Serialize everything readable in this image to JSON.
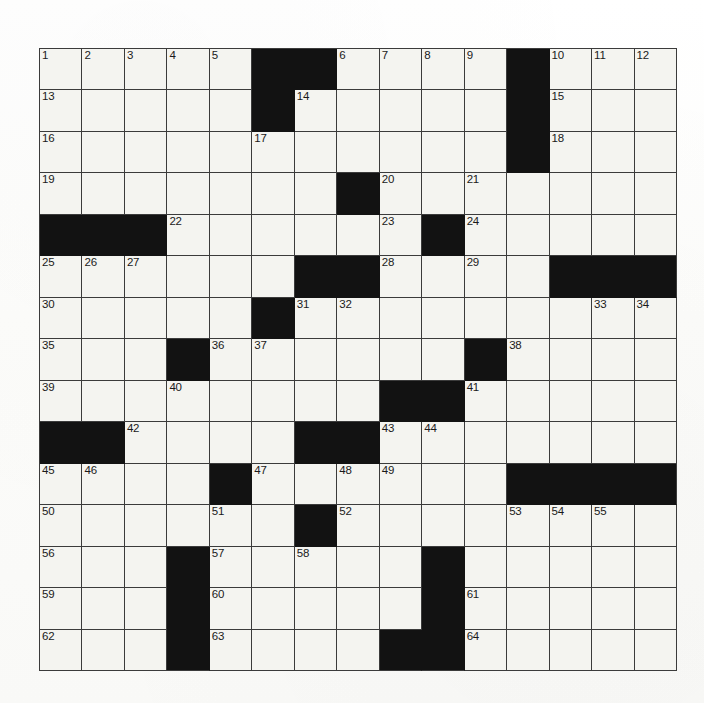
{
  "puzzle": {
    "type": "crossword-grid",
    "title": "",
    "rows": 15,
    "columns": 15,
    "cell_size_px": 42.5,
    "colors": {
      "block": "#121212",
      "cell": "#f4f4f0",
      "grid_line": "#3b3b3b",
      "number": "#1a1a1a",
      "paper": "#fdfdfb"
    },
    "blocks": [
      [
        0,
        5
      ],
      [
        0,
        6
      ],
      [
        0,
        11
      ],
      [
        1,
        5
      ],
      [
        1,
        11
      ],
      [
        2,
        11
      ],
      [
        3,
        7
      ],
      [
        4,
        0
      ],
      [
        4,
        1
      ],
      [
        4,
        2
      ],
      [
        4,
        9
      ],
      [
        5,
        6
      ],
      [
        5,
        7
      ],
      [
        5,
        12
      ],
      [
        5,
        13
      ],
      [
        5,
        14
      ],
      [
        6,
        5
      ],
      [
        7,
        3
      ],
      [
        7,
        10
      ],
      [
        8,
        8
      ],
      [
        8,
        9
      ],
      [
        9,
        0
      ],
      [
        9,
        1
      ],
      [
        9,
        6
      ],
      [
        9,
        7
      ],
      [
        10,
        4
      ],
      [
        10,
        11
      ],
      [
        10,
        12
      ],
      [
        10,
        13
      ],
      [
        10,
        14
      ],
      [
        11,
        6
      ],
      [
        12,
        3
      ],
      [
        12,
        9
      ],
      [
        13,
        3
      ],
      [
        13,
        9
      ],
      [
        14,
        3
      ],
      [
        14,
        8
      ],
      [
        14,
        9
      ]
    ],
    "numbers": {
      "0": {
        "0": "1",
        "1": "2",
        "2": "3",
        "3": "4",
        "4": "5",
        "7": "6",
        "8": "7",
        "9": "8",
        "10": "9",
        "12": "10",
        "13": "11",
        "14": "12"
      },
      "1": {
        "0": "13",
        "6": "14",
        "12": "15"
      },
      "2": {
        "0": "16",
        "5": "17",
        "12": "18"
      },
      "3": {
        "0": "19",
        "8": "20",
        "10": "21"
      },
      "4": {
        "3": "22",
        "8": "23",
        "10": "24"
      },
      "5": {
        "0": "25",
        "1": "26",
        "2": "27",
        "8": "28",
        "10": "29"
      },
      "6": {
        "0": "30",
        "6": "31",
        "7": "32",
        "13": "33",
        "14": "34"
      },
      "7": {
        "0": "35",
        "4": "36",
        "5": "37",
        "11": "38"
      },
      "8": {
        "0": "39",
        "3": "40",
        "10": "41"
      },
      "9": {
        "2": "42",
        "8": "43",
        "9": "44"
      },
      "10": {
        "0": "45",
        "1": "46",
        "5": "47",
        "7": "48",
        "8": "49"
      },
      "11": {
        "0": "50",
        "4": "51",
        "7": "52",
        "11": "53",
        "12": "54",
        "13": "55"
      },
      "12": {
        "0": "56",
        "4": "57",
        "6": "58"
      },
      "13": {
        "0": "59",
        "4": "60",
        "10": "61"
      },
      "14": {
        "0": "62",
        "4": "63",
        "10": "64"
      }
    },
    "letters": {},
    "highest_number": "64"
  }
}
